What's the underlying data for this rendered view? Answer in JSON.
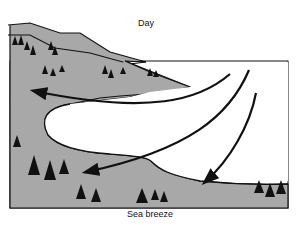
{
  "diagram": {
    "title": "Day",
    "caption": "Sea breeze",
    "colors": {
      "land": "#a8a8a8",
      "water": "#ffffff",
      "outline": "#111111",
      "arrow": "#111111"
    },
    "elements": {
      "land_left": "forested hillside and lowland (gray)",
      "water": "bay / sea (white)",
      "peninsula": "forested land spit extending into bay",
      "arrows": [
        {
          "id": "upper",
          "from": "sea (upper right)",
          "to": "land (upper left)"
        },
        {
          "id": "middle",
          "from": "sea (upper right)",
          "to": "land (lower left)"
        },
        {
          "id": "lower",
          "from": "sea (right)",
          "to": "shore (bottom center-right)"
        }
      ],
      "trees": "conifer tree groups on land"
    }
  }
}
